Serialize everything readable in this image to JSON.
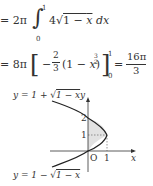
{
  "equation1": {
    "prefix": "= 2π",
    "integral_sign": "∫",
    "upper": "1",
    "lower": "0",
    "integrand": "4√(1 − x) dx"
  },
  "equation2": {
    "prefix": "= 8π",
    "bracket_content": "− 2/3 (1 − x)^(3/2)",
    "upper": "1",
    "lower": "0",
    "result": "= 16π/3"
  },
  "graph": {
    "upper_curve_label": "y = 1 + √(1 − x)",
    "lower_curve_label": "y = 1 − √(1 − x)",
    "y_axis_label": "y",
    "x_axis_label": "x",
    "origin_label": "O",
    "y_ticks": [
      "2",
      "1"
    ],
    "x_ticks": [
      "1"
    ]
  }
}
